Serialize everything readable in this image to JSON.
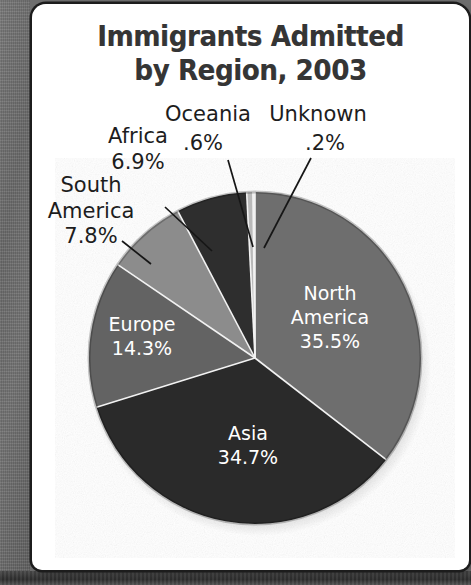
{
  "figure": {
    "width": 471,
    "height": 585,
    "card_background": "#ffffff",
    "border_color": "#1c1c1c"
  },
  "chart_data": {
    "type": "pie",
    "title": "Immigrants Admitted by Region, 2003",
    "title_line1": "Immigrants Admitted",
    "title_line2": "by Region, 2003",
    "xlabel": "",
    "ylabel": "",
    "units": "percent",
    "total": 100.0,
    "legend_position": "none",
    "grid": false,
    "start_angle_deg": 0,
    "direction": "clockwise",
    "categories": [
      "North America",
      "Asia",
      "Europe",
      "South America",
      "Africa",
      "Oceania",
      "Unknown"
    ],
    "values": [
      35.5,
      34.7,
      14.3,
      7.8,
      6.9,
      0.6,
      0.2
    ],
    "slices": [
      {
        "label": "North America",
        "label_line1": "North",
        "label_line2": "America",
        "value": 35.5,
        "value_text": "35.5%",
        "color": "#6e6e6e",
        "label_placement": "inside",
        "label_color": "#ffffff"
      },
      {
        "label": "Asia",
        "label_line1": "Asia",
        "label_line2": "",
        "value": 34.7,
        "value_text": "34.7%",
        "color": "#2b2b2b",
        "label_placement": "inside",
        "label_color": "#ffffff"
      },
      {
        "label": "Europe",
        "label_line1": "Europe",
        "label_line2": "",
        "value": 14.3,
        "value_text": "14.3%",
        "color": "#636363",
        "label_placement": "inside",
        "label_color": "#ffffff"
      },
      {
        "label": "South America",
        "label_line1": "South",
        "label_line2": "America",
        "value": 7.8,
        "value_text": "7.8%",
        "color": "#8c8c8c",
        "label_placement": "outside",
        "label_color": "#1d1d1d"
      },
      {
        "label": "Africa",
        "label_line1": "Africa",
        "label_line2": "",
        "value": 6.9,
        "value_text": "6.9%",
        "color": "#2e2e2e",
        "label_placement": "outside",
        "label_color": "#1d1d1d"
      },
      {
        "label": "Oceania",
        "label_line1": "Oceania",
        "label_line2": "",
        "value": 0.6,
        "value_text": ".6%",
        "color": "#b9b9b9",
        "label_placement": "outside",
        "label_color": "#1d1d1d"
      },
      {
        "label": "Unknown",
        "label_line1": "Unknown",
        "label_line2": "",
        "value": 0.2,
        "value_text": ".2%",
        "color": "#e9e9e9",
        "label_placement": "outside",
        "label_color": "#1d1d1d"
      }
    ]
  }
}
